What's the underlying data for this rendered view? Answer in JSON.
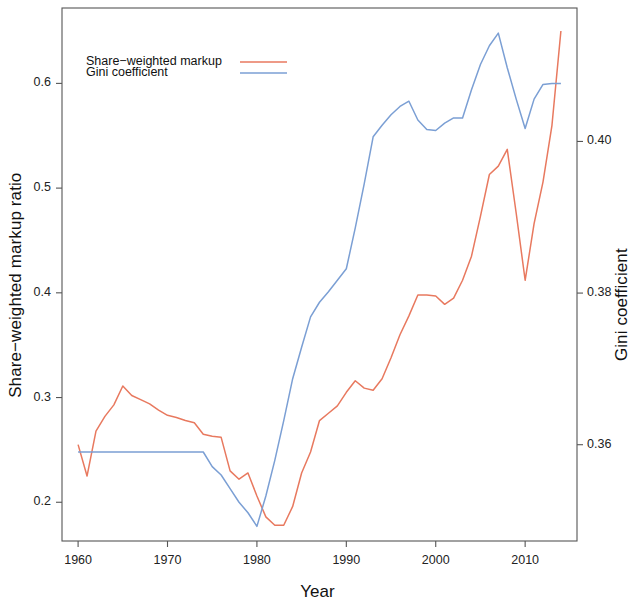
{
  "chart_data": {
    "type": "line",
    "title": "",
    "xlabel": "Year",
    "ylabel": "Share−weighted markup ratio",
    "ylabel_right": "Gini coefficient",
    "xlim": [
      1958.2,
      2015.8
    ],
    "ylim": [
      0.163,
      0.672
    ],
    "ylim_right": [
      0.3473,
      0.4176
    ],
    "grid": false,
    "legend_position": "top-left-inside",
    "xticks": [
      1960,
      1970,
      1980,
      1990,
      2000,
      2010
    ],
    "xtick_labels": [
      "1960",
      "1970",
      "1980",
      "1990",
      "2000",
      "2010"
    ],
    "yticks": [
      0.2,
      0.3,
      0.4,
      0.5,
      0.6
    ],
    "ytick_labels": [
      "0.2",
      "0.3",
      "0.4",
      "0.5",
      "0.6"
    ],
    "yticks_right": [
      0.36,
      0.38,
      0.4
    ],
    "ytick_labels_right": [
      "0.36",
      "0.38",
      "0.40"
    ],
    "colors": {
      "share_weighted_markup": "#e8795f",
      "gini_coefficient": "#7b9fd4",
      "axis": "#555555",
      "text": "#111111",
      "background": "#ffffff"
    },
    "series": [
      {
        "name": "Share−weighted markup",
        "color": "#e8795f",
        "axis": "left",
        "x": [
          1960,
          1961,
          1962,
          1963,
          1964,
          1965,
          1966,
          1967,
          1968,
          1969,
          1970,
          1971,
          1972,
          1973,
          1974,
          1975,
          1976,
          1977,
          1978,
          1979,
          1980,
          1981,
          1982,
          1983,
          1984,
          1985,
          1986,
          1987,
          1988,
          1989,
          1990,
          1991,
          1992,
          1993,
          1994,
          1995,
          1996,
          1997,
          1998,
          1999,
          2000,
          2001,
          2002,
          2003,
          2004,
          2005,
          2006,
          2007,
          2008,
          2009,
          2010,
          2011,
          2012,
          2013,
          2014
        ],
        "values": [
          0.255,
          0.225,
          0.268,
          0.282,
          0.293,
          0.311,
          0.302,
          0.298,
          0.294,
          0.288,
          0.283,
          0.281,
          0.278,
          0.276,
          0.265,
          0.263,
          0.262,
          0.23,
          0.222,
          0.228,
          0.206,
          0.186,
          0.178,
          0.178,
          0.196,
          0.228,
          0.248,
          0.278,
          0.285,
          0.292,
          0.305,
          0.316,
          0.309,
          0.307,
          0.318,
          0.338,
          0.36,
          0.378,
          0.398,
          0.398,
          0.397,
          0.389,
          0.395,
          0.412,
          0.435,
          0.473,
          0.513,
          0.521,
          0.537,
          0.476,
          0.412,
          0.466,
          0.506,
          0.56,
          0.65
        ]
      },
      {
        "name": "Gini coefficient",
        "color": "#7b9fd4",
        "axis": "right",
        "x": [
          1960,
          1961,
          1962,
          1963,
          1964,
          1965,
          1966,
          1967,
          1968,
          1969,
          1970,
          1971,
          1972,
          1973,
          1974,
          1975,
          1976,
          1977,
          1978,
          1979,
          1980,
          1981,
          1982,
          1983,
          1984,
          1985,
          1986,
          1987,
          1988,
          1989,
          1990,
          1991,
          1992,
          1993,
          1994,
          1995,
          1996,
          1997,
          1998,
          1999,
          2000,
          2001,
          2002,
          2003,
          2004,
          2005,
          2006,
          2007,
          2008,
          2009,
          2010,
          2011,
          2012,
          2013,
          2014
        ],
        "values_left_scale": [
          0.248,
          0.248,
          0.248,
          0.248,
          0.248,
          0.248,
          0.248,
          0.248,
          0.248,
          0.248,
          0.248,
          0.248,
          0.248,
          0.248,
          0.248,
          0.234,
          0.226,
          0.213,
          0.2,
          0.19,
          0.177,
          0.206,
          0.24,
          0.278,
          0.318,
          0.348,
          0.377,
          0.391,
          0.401,
          0.412,
          0.423,
          0.462,
          0.504,
          0.549,
          0.56,
          0.57,
          0.578,
          0.583,
          0.565,
          0.556,
          0.555,
          0.562,
          0.567,
          0.567,
          0.594,
          0.618,
          0.636,
          0.648,
          0.615,
          0.585,
          0.557,
          0.585,
          0.599,
          0.6,
          0.6
        ],
        "values_gini": [
          0.359,
          0.359,
          0.359,
          0.359,
          0.359,
          0.359,
          0.359,
          0.359,
          0.359,
          0.359,
          0.359,
          0.359,
          0.359,
          0.359,
          0.359,
          0.3571,
          0.356,
          0.3542,
          0.3524,
          0.351,
          0.3492,
          0.3532,
          0.3579,
          0.3632,
          0.3687,
          0.3728,
          0.3768,
          0.3788,
          0.3801,
          0.3816,
          0.3832,
          0.3885,
          0.3944,
          0.4006,
          0.4021,
          0.4035,
          0.4046,
          0.4053,
          0.4028,
          0.4016,
          0.4014,
          0.4024,
          0.4031,
          0.4031,
          0.4068,
          0.4101,
          0.4126,
          0.4143,
          0.4097,
          0.4056,
          0.4017,
          0.4056,
          0.4075,
          0.4077,
          0.4077
        ]
      }
    ],
    "legend": [
      {
        "label": "Share−weighted markup",
        "color": "#e8795f"
      },
      {
        "label": "Gini coefficient",
        "color": "#7b9fd4"
      }
    ]
  }
}
